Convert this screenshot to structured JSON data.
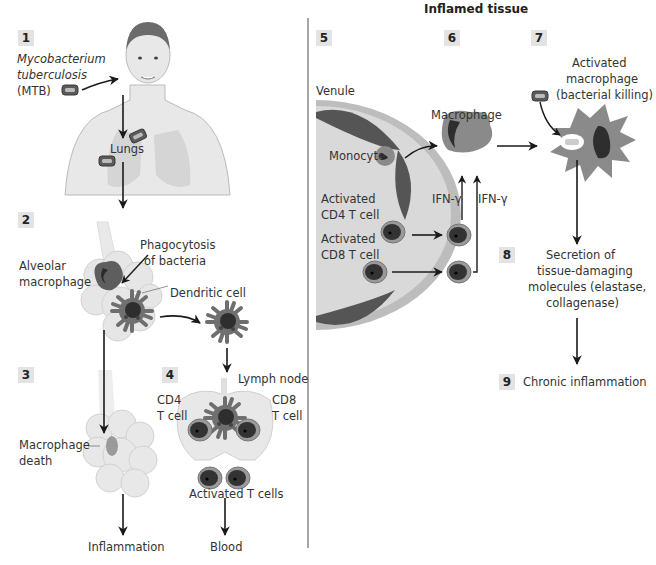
{
  "title": "Inflamed tissue",
  "steps": [
    {
      "num": "1",
      "x": 18,
      "y": 30
    },
    {
      "num": "2",
      "x": 18,
      "y": 212
    },
    {
      "num": "3",
      "x": 18,
      "y": 367
    },
    {
      "num": "4",
      "x": 162,
      "y": 367
    },
    {
      "num": "5",
      "x": 316,
      "y": 30
    },
    {
      "num": "6",
      "x": 444,
      "y": 30
    },
    {
      "num": "7",
      "x": 531,
      "y": 30
    },
    {
      "num": "8",
      "x": 499,
      "y": 247
    },
    {
      "num": "9",
      "x": 499,
      "y": 374
    }
  ],
  "labels": {
    "mtb_line1": "Mycobacterium",
    "mtb_line2": "tuberculosis",
    "mtb_line3": "(MTB)",
    "lungs": "Lungs",
    "phagocytosis_line1": "Phagocytosis",
    "phagocytosis_line2": "of bacteria",
    "alveolar_line1": "Alveolar",
    "alveolar_line2": "macrophage",
    "dendritic_cell": "Dendritic cell",
    "lymph_node": "Lymph node",
    "cd4_line1": "CD4",
    "cd4_line2": "T cell",
    "cd8_line1": "CD8",
    "cd8_line2": "T cell",
    "macrophage_death_line1": "Macrophage",
    "macrophage_death_line2": "death",
    "activated_t_cells": "Activated T cells",
    "inflammation": "Inflammation",
    "blood": "Blood",
    "venule": "Venule",
    "monocyte": "Monocyte",
    "act_cd4_line1": "Activated",
    "act_cd4_line2": "CD4 T cell",
    "act_cd8_line1": "Activated",
    "act_cd8_line2": "CD8 T cell",
    "macrophage": "Macrophage",
    "ifn1": "IFN-γ",
    "ifn2": "IFN-γ",
    "act_mac_line1": "Activated",
    "act_mac_line2": "macrophage",
    "act_mac_line3": "(bacterial killing)",
    "secretion_line1": "Secretion of",
    "secretion_line2": "tissue-damaging",
    "secretion_line3": "molecules (elastase,",
    "secretion_line4": "collagenase)",
    "chronic": "Chronic inflammation"
  },
  "colors": {
    "step_bg": "#e3e3e3",
    "cell_dark": "#3d3d3d",
    "cell_mid": "#7a7a7a",
    "cell_light": "#b5b5b5",
    "tissue": "#e6e6e6",
    "arrow": "#1a1a1a",
    "divider": "#888888"
  }
}
